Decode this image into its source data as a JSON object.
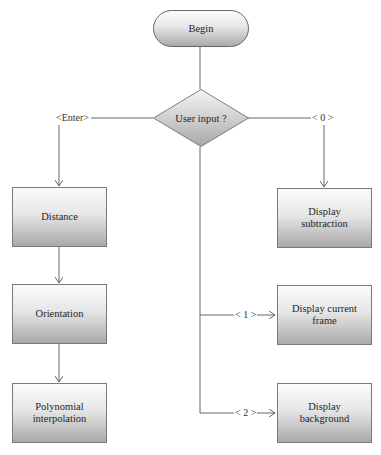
{
  "diagram": {
    "type": "flowchart",
    "colors": {
      "line": "#555555",
      "node_top": "#fbfbfb",
      "node_bottom": "#a9a9a9",
      "border": "#7a7a7a"
    },
    "start": {
      "label": "Begin"
    },
    "decision": {
      "label": "User input ?"
    },
    "branches": {
      "enter": {
        "label": "<Enter>"
      },
      "zero": {
        "label": "< 0 >"
      },
      "one": {
        "label": "< 1 >"
      },
      "two": {
        "label": "< 2 >"
      }
    },
    "nodes": {
      "distance": {
        "label": "Distance"
      },
      "orientation": {
        "label": "Orientation"
      },
      "polynomial": {
        "label": "Polynomial interpolation"
      },
      "display_subtraction": {
        "label": "Display subtraction"
      },
      "display_current_frame": {
        "label": "Display current frame"
      },
      "display_background": {
        "label": "Display background"
      }
    }
  }
}
